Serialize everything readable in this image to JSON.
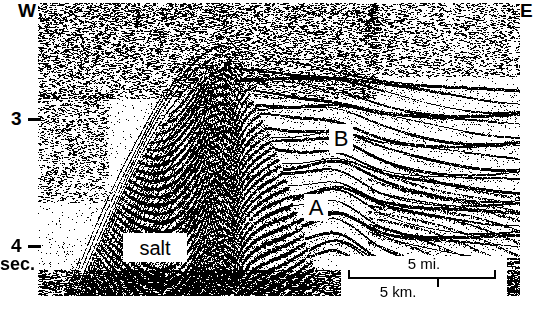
{
  "figure": {
    "type": "seismic-reflection-section",
    "width": 536,
    "height": 309,
    "background_color": "#ffffff",
    "ink_color": "#000000"
  },
  "orientation": {
    "left_label": "W",
    "right_label": "E"
  },
  "depth_axis": {
    "unit_label": "sec.",
    "ticks": [
      {
        "label": "3",
        "y": 119
      },
      {
        "label": "4",
        "y": 246
      }
    ]
  },
  "annotations": [
    {
      "id": "horizon-b",
      "label": "B",
      "x": 341,
      "y": 138
    },
    {
      "id": "horizon-a",
      "label": "A",
      "x": 316,
      "y": 207
    },
    {
      "id": "salt-body",
      "label": "salt",
      "x": 155,
      "y": 247
    }
  ],
  "scalebar": {
    "miles_label": "5 mi.",
    "kilometers_label": "5 km.",
    "miles_value": 5,
    "kilometers_value": 5
  },
  "chart_data": {
    "type": "heatmap",
    "title": "",
    "xlabel": "",
    "ylabel": "sec.",
    "x_endpoints": [
      "W",
      "E"
    ],
    "ylim": [
      2.45,
      4.5
    ],
    "yticks": [
      3,
      4
    ],
    "grid": false,
    "legend_position": "none",
    "panel_box": {
      "x": 38,
      "y": 3,
      "width": 482,
      "height": 293
    },
    "seed": 20240917,
    "structures": [
      {
        "name": "incoherent-noise-upper-left",
        "kind": "speckle",
        "density": 0.42,
        "region": {
          "x0": 0,
          "y0": 0,
          "x1": 330,
          "y1": 90
        }
      },
      {
        "name": "incoherent-noise-upper-right",
        "kind": "speckle",
        "density": 0.3,
        "region": {
          "x0": 330,
          "y0": 0,
          "x1": 482,
          "y1": 70
        }
      },
      {
        "name": "salt-dome-core",
        "kind": "chaotic",
        "crest_x": 185,
        "crest_y": 62,
        "left_x": 60,
        "right_x": 285,
        "base_y": 293
      },
      {
        "name": "flank-dipping-reflectors-west",
        "kind": "dipping",
        "dip": -0.95
      },
      {
        "name": "layered-strata-east",
        "kind": "layered",
        "layer_count": 26,
        "arch_amplitude": 14
      }
    ]
  }
}
